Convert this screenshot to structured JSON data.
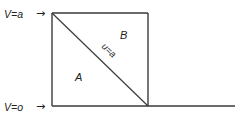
{
  "diagram": {
    "labels": {
      "top_voltage": "V=a",
      "bottom_voltage": "V=o",
      "region_a": "A",
      "region_b": "B",
      "diagonal": "u=a"
    },
    "arrows": {
      "top": "→",
      "bottom": "→"
    },
    "colors": {
      "line": "#3a3a3a",
      "text": "#222222",
      "background": "#ffffff"
    },
    "geometry": {
      "box_left": 52,
      "box_top": 13,
      "box_right": 148,
      "box_bottom": 106,
      "baseline_end": 235
    }
  }
}
